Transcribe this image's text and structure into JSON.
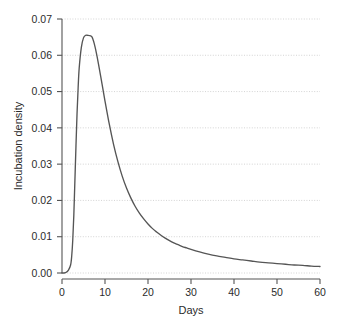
{
  "chart_data": {
    "type": "line",
    "title": "",
    "xlabel": "Days",
    "ylabel": "Incubation density",
    "xlim": [
      0,
      60
    ],
    "ylim": [
      0.0,
      0.07
    ],
    "grid": true,
    "legend": "none",
    "line_color": "#555555",
    "grid_color": "#cfcfcf",
    "axis_color": "#555555",
    "xticks": [
      "0",
      "10",
      "20",
      "30",
      "40",
      "50",
      "60"
    ],
    "xtick_values": [
      0,
      10,
      20,
      30,
      40,
      50,
      60
    ],
    "yticks": [
      "0.00",
      "0.01",
      "0.02",
      "0.03",
      "0.04",
      "0.05",
      "0.06",
      "0.07"
    ],
    "ytick_values": [
      0.0,
      0.01,
      0.02,
      0.03,
      0.04,
      0.05,
      0.06,
      0.07
    ],
    "peak": {
      "x": 7.0,
      "y": 0.0655
    },
    "series": [
      {
        "name": "Incubation density",
        "x": [
          0,
          0.5,
          1,
          1.5,
          2,
          2.25,
          2.5,
          2.75,
          3,
          3.25,
          3.5,
          3.75,
          4,
          4.5,
          5,
          5.5,
          6,
          6.5,
          7,
          7.5,
          8,
          8.5,
          9,
          9.5,
          10,
          11,
          12,
          13,
          14,
          15,
          16,
          17,
          18,
          19,
          20,
          21,
          22,
          23,
          24,
          25,
          26,
          27,
          28,
          29,
          30,
          32,
          34,
          36,
          38,
          40,
          42,
          44,
          46,
          48,
          50,
          52,
          54,
          56,
          58,
          60
        ],
        "y": [
          0.0,
          0.0,
          0.0002,
          0.0008,
          0.0022,
          0.0045,
          0.009,
          0.016,
          0.0255,
          0.035,
          0.044,
          0.051,
          0.0565,
          0.0622,
          0.0648,
          0.0655,
          0.0655,
          0.0654,
          0.065,
          0.0632,
          0.0606,
          0.0575,
          0.0542,
          0.0508,
          0.0474,
          0.041,
          0.0354,
          0.0307,
          0.0267,
          0.0234,
          0.0207,
          0.0184,
          0.0165,
          0.0149,
          0.0135,
          0.0123,
          0.0113,
          0.0104,
          0.0096,
          0.0089,
          0.0083,
          0.0078,
          0.0073,
          0.0069,
          0.0065,
          0.0058,
          0.0052,
          0.0047,
          0.0043,
          0.0039,
          0.0036,
          0.0033,
          0.003,
          0.0028,
          0.0026,
          0.0024,
          0.0022,
          0.0021,
          0.0019,
          0.0018
        ]
      }
    ]
  }
}
